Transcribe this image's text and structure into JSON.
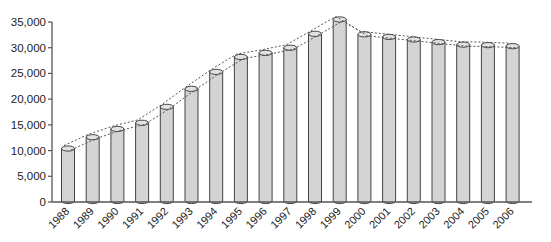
{
  "chart_data": {
    "type": "bar",
    "title": "",
    "xlabel": "",
    "ylabel": "",
    "categories": [
      "1988",
      "1989",
      "1990",
      "1991",
      "1992",
      "1993",
      "1994",
      "1995",
      "1996",
      "1997",
      "1998",
      "1999",
      "2000",
      "2001",
      "2002",
      "2003",
      "2004",
      "2005",
      "2006"
    ],
    "values": [
      10400,
      12600,
      14200,
      15400,
      18500,
      22000,
      25300,
      28200,
      29000,
      30000,
      32700,
      35500,
      32600,
      32100,
      31600,
      31100,
      30600,
      30500,
      30300
    ],
    "ylim": [
      0,
      35000
    ],
    "yticks": [
      0,
      5000,
      10000,
      15000,
      20000,
      25000,
      30000,
      35000
    ],
    "ytick_labels": [
      "0",
      "5,000",
      "10,000",
      "15,000",
      "20,000",
      "25,000",
      "30,000",
      "35,000"
    ],
    "grid": false,
    "legend": null,
    "bar_style": "3D cylinder",
    "annotations": "Two dotted envelope lines trace above the cylinder tops",
    "colors": {
      "bar_fill": "#d4d4d4",
      "bar_edge": "#444444",
      "axis": "#555555",
      "dotted_line": "#555555"
    }
  }
}
